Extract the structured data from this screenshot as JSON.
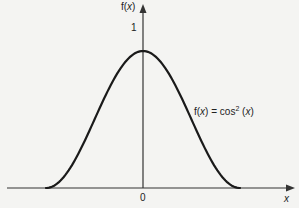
{
  "chart_data": {
    "type": "line",
    "title": "",
    "xlabel": "x",
    "ylabel": "f(x)",
    "series": [
      {
        "name": "f(x) = cos² (x)",
        "function": "cos^2(x)",
        "x": [
          -1.5708,
          -1.2,
          -0.9,
          -0.6,
          -0.3,
          0,
          0.3,
          0.6,
          0.9,
          1.2,
          1.5708
        ],
        "values": [
          0,
          0.131,
          0.386,
          0.681,
          0.913,
          1,
          0.913,
          0.681,
          0.386,
          0.131,
          0
        ]
      }
    ],
    "x_ticks": [
      "0"
    ],
    "y_ticks": [
      "1"
    ],
    "annotations": [
      "f(x) = cos² (x)"
    ],
    "grid": false,
    "legend": "none"
  },
  "labels": {
    "y_axis": "f(x)",
    "x_axis": "x",
    "origin": "0",
    "peak": "1",
    "curve_fn": "f(x) = cos",
    "curve_sup": "2",
    "curve_arg": " (x)"
  },
  "colors": {
    "line": "#1a1a1a",
    "axis": "#333333",
    "background": "#f4f4f2"
  }
}
